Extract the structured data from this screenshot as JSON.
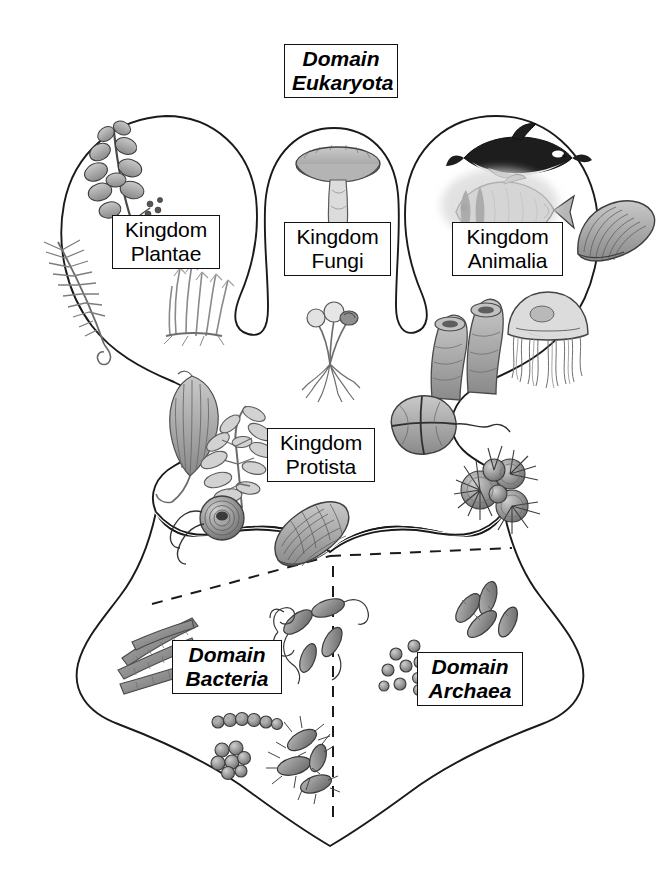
{
  "diagram": {
    "background_color": "#ffffff",
    "line_color": "#1a1a1a",
    "box_border_color": "#111111",
    "organism_fill": "#9a9a9a"
  },
  "labels": {
    "eukaryota": {
      "line1": "Domain",
      "line2": "Eukaryota",
      "style": "bold-italic"
    },
    "plantae": {
      "line1": "Kingdom",
      "line2": "Plantae",
      "style": "regular"
    },
    "fungi": {
      "line1": "Kingdom",
      "line2": "Fungi",
      "style": "regular"
    },
    "animalia": {
      "line1": "Kingdom",
      "line2": "Animalia",
      "style": "regular"
    },
    "protista": {
      "line1": "Kingdom",
      "line2": "Protista",
      "style": "regular"
    },
    "bacteria": {
      "line1": "Domain",
      "line2": "Bacteria",
      "style": "bold-italic"
    },
    "archaea": {
      "line1": "Domain",
      "line2": "Archaea",
      "style": "bold-italic"
    }
  },
  "organisms": {
    "plantae": [
      "flowering-branch-icon",
      "fern-frond-icon",
      "moss-clump-icon"
    ],
    "fungi": [
      "mushroom-icon",
      "mold-sporangia-icon"
    ],
    "animalia": [
      "orca-whale-icon",
      "butterflyfish-icon",
      "clam-shell-icon",
      "tube-sponge-icon",
      "jellyfish-icon"
    ],
    "protista": [
      "kelp-blade-icon",
      "brown-algae-icon",
      "flagellate-icon",
      "diatom-icon",
      "dinoflagellate-icon",
      "radiolarian-icon"
    ],
    "bacteria": [
      "filamentous-bacteria-icon",
      "vibrio-flagellated-icon",
      "streptococcus-chain-icon",
      "staphylococcus-cluster-icon",
      "flagellated-bacilli-icon"
    ],
    "archaea": [
      "archaeal-cocci-icon",
      "archaeal-rods-icon"
    ]
  },
  "dividers": {
    "eukaryote_prokaryote": "dashed",
    "bacteria_archaea": "dashed"
  }
}
